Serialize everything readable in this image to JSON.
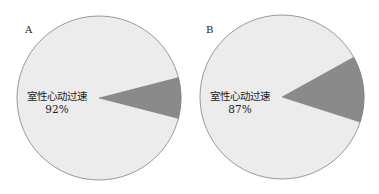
{
  "chart_data": [
    {
      "type": "pie",
      "panel_label": "A",
      "center": [
        99,
        98
      ],
      "radius": 82,
      "slices": [
        {
          "label": "室性心动过速",
          "value": 92,
          "display": "92%",
          "color": "#ececec"
        },
        {
          "label": "",
          "value": 8,
          "display": "",
          "color": "#8a8a8a"
        }
      ],
      "minor_slice_start_deg": -14.4,
      "label_text": "室性心动过速",
      "label_value": "92%",
      "label_pos": [
        57,
        100
      ]
    },
    {
      "type": "pie",
      "panel_label": "B",
      "center": [
        282,
        97
      ],
      "radius": 82,
      "slices": [
        {
          "label": "室性心动过速",
          "value": 87,
          "display": "87%",
          "color": "#ececec"
        },
        {
          "label": "",
          "value": 13,
          "display": "",
          "color": "#8a8a8a"
        }
      ],
      "minor_slice_start_deg": -29,
      "label_text": "室性心动过速",
      "label_value": "87%",
      "label_pos": [
        240,
        100
      ]
    }
  ],
  "colors": {
    "major": "#ececec",
    "minor": "#8a8a8a",
    "outline": "#9a9a9a",
    "background": "#ffffff"
  }
}
